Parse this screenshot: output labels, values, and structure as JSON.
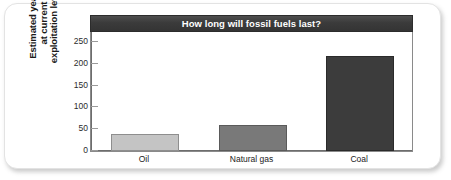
{
  "chart_data": {
    "type": "bar",
    "title": "How long will fossil fuels last?",
    "categories": [
      "Oil",
      "Natural gas",
      "Coal"
    ],
    "values": [
      40,
      60,
      218
    ],
    "series": [
      {
        "name": "Estimated years at current exploitation levels",
        "values": [
          40,
          60,
          218
        ]
      }
    ],
    "xlabel": "",
    "ylabel": "Estimated years at current exploitation levels",
    "ylabel_lines": [
      "Estimated years",
      "at current",
      "exploitation levels"
    ],
    "ylim": [
      0,
      275
    ],
    "yticks": [
      0,
      50,
      100,
      150,
      200,
      250
    ],
    "ytick_labels": [
      "0",
      "50",
      "100",
      "150",
      "200",
      "250"
    ],
    "grid": false,
    "legend": "none",
    "bar_colors": [
      "#c4c4c4",
      "#797979",
      "#3c3c3c"
    ],
    "bar_edge_colors": [
      "#8e8e8e",
      "#5a5a5a",
      "#2a2a2a"
    ],
    "title_bar_color": "#3b3b3b",
    "title_text_color": "#ffffff",
    "plot_background": "#ffffff",
    "axis_color": "#6d6d6d"
  }
}
